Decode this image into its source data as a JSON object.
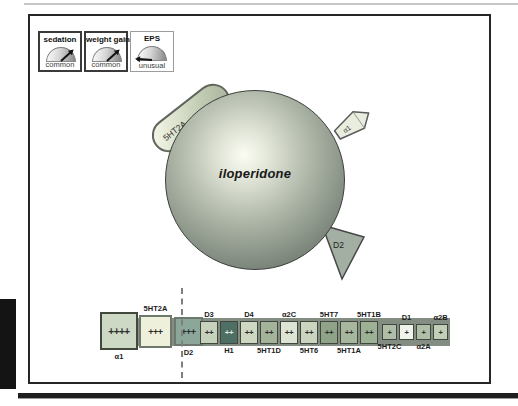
{
  "figure": {
    "drug": {
      "name": "iloperidone"
    },
    "side_effect_gauges": [
      {
        "title": "sedation",
        "frequency": "common"
      },
      {
        "title": "weight gain",
        "frequency": "common"
      },
      {
        "title": "EPS",
        "frequency": "unusual"
      }
    ],
    "receptor_tabs": [
      {
        "label": "5HT2A"
      },
      {
        "label": "α1"
      },
      {
        "label": "D2"
      }
    ],
    "binding_strip": {
      "boxes": [
        {
          "label": "α1",
          "affinity": "++++",
          "fill": "#cdd8c5"
        },
        {
          "label": "5HT2A",
          "affinity": "+++",
          "fill": "#eef0dc"
        },
        {
          "label": "D2",
          "affinity": "+++",
          "fill": "#8ba79a"
        },
        {
          "label": "D3",
          "affinity": "++",
          "fill": "#c6d2bb"
        },
        {
          "label": "H1",
          "affinity": "++",
          "fill": "#4e6f63"
        },
        {
          "label": "D4",
          "affinity": "++",
          "fill": "#cdd7c1"
        },
        {
          "label": "5HT1D",
          "affinity": "++",
          "fill": "#a3b49b"
        },
        {
          "label": "α2C",
          "affinity": "++",
          "fill": "#dde4d3"
        },
        {
          "label": "5HT6",
          "affinity": "++",
          "fill": "#cad4be"
        },
        {
          "label": "5HT7",
          "affinity": "++",
          "fill": "#8ea388"
        },
        {
          "label": "5HT1A",
          "affinity": "++",
          "fill": "#a6b79d"
        },
        {
          "label": "5HT1B",
          "affinity": "++",
          "fill": "#9db295"
        },
        {
          "label": "5HT2C",
          "affinity": "+",
          "fill": "#afbea7"
        },
        {
          "label": "D1",
          "affinity": "+",
          "fill": "#f0f2ec"
        },
        {
          "label": "α2A",
          "affinity": "+",
          "fill": "#afbea7"
        },
        {
          "label": "α2B",
          "affinity": "+",
          "fill": "#c3ceb9"
        }
      ]
    },
    "colors": {
      "strip_band": "#848d81",
      "sphere_edge": "#5f6960",
      "sphere_highlight": "#fbfcf3"
    }
  }
}
